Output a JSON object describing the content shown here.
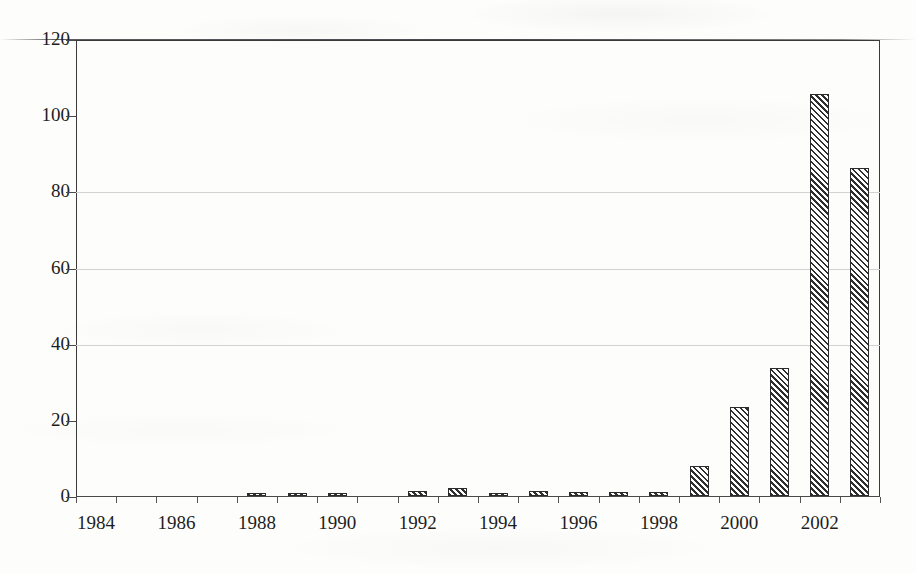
{
  "chart_data": {
    "type": "bar",
    "title": "",
    "subtitle": "",
    "xlabel": "",
    "ylabel": "",
    "categories": [
      "1984",
      "1985",
      "1986",
      "1987",
      "1988",
      "1989",
      "1990",
      "1991",
      "1992",
      "1993",
      "1994",
      "1995",
      "1996",
      "1997",
      "1998",
      "1999",
      "2000",
      "2001",
      "2002",
      "2003"
    ],
    "values": [
      0,
      0,
      0,
      0,
      0.7,
      0.7,
      0.7,
      0,
      1.3,
      2.2,
      0.5,
      1.4,
      1.1,
      1.0,
      1.0,
      8,
      23.5,
      33.5,
      105.5,
      86
    ],
    "x_tick_labels": [
      "1984",
      "1986",
      "1988",
      "1990",
      "1992",
      "1994",
      "1996",
      "1998",
      "2000",
      "2002"
    ],
    "x_tick_categories": [
      "1984",
      "1986",
      "1988",
      "1990",
      "1992",
      "1994",
      "1996",
      "1998",
      "2000",
      "2002"
    ],
    "y_tick_labels": [
      "0",
      "20",
      "40",
      "60",
      "80",
      "100",
      "120"
    ],
    "y_ticks": [
      0,
      20,
      40,
      60,
      80,
      100,
      120
    ],
    "ylim": [
      0,
      120
    ],
    "gridlines": [
      40,
      60,
      80
    ],
    "grid": true,
    "legend": "none",
    "bar_fill": "diagonal-hatch",
    "bar_border_color": "#2b2b2b",
    "axis_color": "#3a3a3a",
    "gridline_color": "#d2d2d2",
    "background_color": "#fdfdfc"
  }
}
